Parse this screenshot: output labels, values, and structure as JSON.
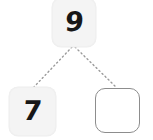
{
  "page": {
    "background_color": "#ffffff"
  },
  "diagram": {
    "type": "number-bond",
    "whole": {
      "id": "whole",
      "value": "9",
      "filled": true,
      "style": "shaded-tile",
      "fill_color": "#f4f4f4",
      "text_color": "#171717"
    },
    "parts": [
      {
        "id": "part-left",
        "value": "7",
        "filled": true,
        "style": "shaded-tile",
        "fill_color": "#f4f4f4",
        "text_color": "#171717"
      },
      {
        "id": "part-right",
        "value": "",
        "filled": false,
        "style": "outlined-answer-box",
        "border_color": "#8d8d8d",
        "fill_color": "#ffffff"
      }
    ],
    "connectors": [
      {
        "id": "connector-left",
        "from": "whole",
        "to": "part-left",
        "style": "dotted",
        "color": "#9a9a9a",
        "x1": 72,
        "y1": 47,
        "x2": 33,
        "y2": 88
      },
      {
        "id": "connector-right",
        "from": "whole",
        "to": "part-right",
        "style": "dotted",
        "color": "#9a9a9a",
        "x1": 75,
        "y1": 47,
        "x2": 117,
        "y2": 88
      }
    ]
  }
}
